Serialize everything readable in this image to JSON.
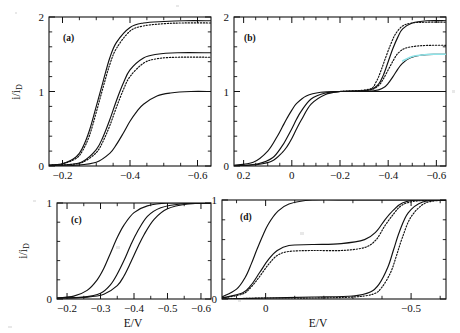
{
  "figure": {
    "y_axis_label_main": "i/i",
    "y_axis_label_sub": "D",
    "x_axis_label": "E/V"
  },
  "panels": [
    {
      "tag": "(a)",
      "x_ticks": [
        "-0.2",
        "-0.4",
        "-0.6"
      ],
      "y_ticks": [
        "0",
        "1",
        "2"
      ],
      "xlim": [
        -0.16,
        -0.64
      ],
      "ylim": [
        0,
        2
      ]
    },
    {
      "tag": "(b)",
      "x_ticks": [
        "0.2",
        "0",
        "-0.2",
        "-0.4",
        "-0.6"
      ],
      "y_ticks": [
        "0",
        "1",
        "2"
      ],
      "xlim": [
        0.24,
        -0.64
      ],
      "ylim": [
        0,
        2
      ]
    },
    {
      "tag": "(c)",
      "x_ticks": [
        "-0.2",
        "-0.3",
        "-0.4",
        "-0.5",
        "-0.6"
      ],
      "y_ticks": [
        "0",
        "1"
      ],
      "xlim": [
        -0.17,
        -0.63
      ],
      "ylim": [
        0,
        1
      ]
    },
    {
      "tag": "(d)",
      "x_ticks": [
        "0",
        "-0.5"
      ],
      "y_ticks": [
        "0",
        "1"
      ],
      "xlim": [
        0.15,
        -0.62
      ],
      "ylim": [
        0,
        1
      ]
    }
  ],
  "chart_data": {
    "type": "line",
    "title": "",
    "xlabel": "E/V",
    "ylabel": "i/i_D",
    "panels": [
      {
        "tag": "(a)",
        "xlim": [
          -0.16,
          -0.64
        ],
        "ylim": [
          0,
          2
        ],
        "xticks": [
          -0.2,
          -0.4,
          -0.6
        ],
        "yticks": [
          0,
          1,
          2
        ],
        "grid": false,
        "legend": "none",
        "series": [
          {
            "name": "a-solid-1",
            "style": "solid",
            "color": "#111111",
            "plateau": 1.95,
            "half_wave": -0.315,
            "slope": 0.048,
            "x": [
              -0.16,
              -0.2,
              -0.24,
              -0.26,
              -0.28,
              -0.3,
              -0.32,
              -0.34,
              -0.36,
              -0.4,
              -0.44,
              -0.5,
              -0.56,
              -0.64
            ],
            "y": [
              0.01,
              0.03,
              0.12,
              0.25,
              0.48,
              0.8,
              1.13,
              1.45,
              1.66,
              1.86,
              1.92,
              1.94,
              1.95,
              1.95
            ]
          },
          {
            "name": "a-dotted-1",
            "style": "dotted",
            "color": "#111111",
            "plateau": 1.92,
            "half_wave": -0.322,
            "slope": 0.05,
            "x": [
              -0.16,
              -0.2,
              -0.24,
              -0.26,
              -0.28,
              -0.3,
              -0.32,
              -0.34,
              -0.36,
              -0.4,
              -0.44,
              -0.5,
              -0.56,
              -0.64
            ],
            "y": [
              0.01,
              0.03,
              0.1,
              0.21,
              0.41,
              0.72,
              1.05,
              1.36,
              1.58,
              1.81,
              1.88,
              1.91,
              1.92,
              1.92
            ]
          },
          {
            "name": "a-solid-2",
            "style": "solid",
            "color": "#111111",
            "plateau": 1.52,
            "half_wave": -0.36,
            "slope": 0.046,
            "x": [
              -0.16,
              -0.22,
              -0.26,
              -0.3,
              -0.32,
              -0.34,
              -0.36,
              -0.38,
              -0.4,
              -0.44,
              -0.48,
              -0.54,
              -0.64
            ],
            "y": [
              0.01,
              0.02,
              0.06,
              0.22,
              0.39,
              0.62,
              0.88,
              1.11,
              1.29,
              1.45,
              1.5,
              1.52,
              1.52
            ]
          },
          {
            "name": "a-dotted-2",
            "style": "dotted",
            "color": "#111111",
            "plateau": 1.46,
            "half_wave": -0.366,
            "slope": 0.048,
            "x": [
              -0.16,
              -0.22,
              -0.26,
              -0.3,
              -0.32,
              -0.34,
              -0.36,
              -0.38,
              -0.4,
              -0.44,
              -0.48,
              -0.54,
              -0.64
            ],
            "y": [
              0.01,
              0.02,
              0.05,
              0.18,
              0.33,
              0.54,
              0.79,
              1.02,
              1.2,
              1.38,
              1.44,
              1.46,
              1.46
            ]
          },
          {
            "name": "a-solid-3",
            "style": "solid",
            "color": "#111111",
            "plateau": 1.0,
            "half_wave": -0.392,
            "slope": 0.05,
            "x": [
              -0.16,
              -0.24,
              -0.3,
              -0.34,
              -0.36,
              -0.38,
              -0.4,
              -0.42,
              -0.44,
              -0.48,
              -0.52,
              -0.58,
              -0.64
            ],
            "y": [
              0.0,
              0.01,
              0.05,
              0.17,
              0.29,
              0.44,
              0.6,
              0.73,
              0.83,
              0.94,
              0.98,
              1.0,
              1.0
            ]
          }
        ]
      },
      {
        "tag": "(b)",
        "xlim": [
          0.24,
          -0.64
        ],
        "ylim": [
          0,
          2
        ],
        "xticks": [
          0.2,
          0.0,
          -0.2,
          -0.4,
          -0.6
        ],
        "yticks": [
          0,
          1,
          2
        ],
        "grid": false,
        "legend": "none",
        "note": "Two-wave voltammograms: first wave rises to a common plateau of 1 near E = 0, second wave rises from 1 to 1.95, 1.6 or stays at 1.",
        "series": [
          {
            "name": "b-wave1-a",
            "style": "solid",
            "color": "#111111",
            "plateau": 1.0,
            "half_wave": 0.045,
            "x": [
              0.24,
              0.16,
              0.1,
              0.06,
              0.04,
              0.02,
              0.0,
              -0.02,
              -0.06,
              -0.12,
              -0.2
            ],
            "y": [
              0.01,
              0.05,
              0.2,
              0.4,
              0.52,
              0.64,
              0.75,
              0.84,
              0.94,
              0.99,
              1.0
            ]
          },
          {
            "name": "b-wave1-b",
            "style": "solid",
            "color": "#111111",
            "plateau": 1.0,
            "half_wave": 0.01,
            "x": [
              0.24,
              0.14,
              0.08,
              0.04,
              0.02,
              0.0,
              -0.02,
              -0.04,
              -0.08,
              -0.14,
              -0.2
            ],
            "y": [
              0.0,
              0.03,
              0.11,
              0.27,
              0.38,
              0.5,
              0.63,
              0.74,
              0.9,
              0.98,
              1.0
            ]
          },
          {
            "name": "b-wave1-c",
            "style": "solid",
            "color": "#111111",
            "plateau": 1.0,
            "half_wave": -0.012,
            "x": [
              0.24,
              0.14,
              0.08,
              0.04,
              0.02,
              0.0,
              -0.02,
              -0.04,
              -0.08,
              -0.14,
              -0.2
            ],
            "y": [
              0.0,
              0.02,
              0.07,
              0.18,
              0.26,
              0.37,
              0.5,
              0.62,
              0.83,
              0.96,
              1.0
            ]
          },
          {
            "name": "b-wave2-solid-high",
            "style": "solid",
            "color": "#111111",
            "plateau": 1.95,
            "half_wave": -0.415,
            "x": [
              -0.2,
              -0.32,
              -0.36,
              -0.38,
              -0.4,
              -0.42,
              -0.44,
              -0.46,
              -0.5,
              -0.56,
              -0.64
            ],
            "y": [
              1.0,
              1.02,
              1.1,
              1.22,
              1.4,
              1.58,
              1.73,
              1.84,
              1.92,
              1.95,
              1.95
            ]
          },
          {
            "name": "b-wave2-dotted-high",
            "style": "dotted",
            "color": "#111111",
            "plateau": 1.93,
            "half_wave": -0.408,
            "x": [
              -0.2,
              -0.32,
              -0.35,
              -0.37,
              -0.39,
              -0.41,
              -0.43,
              -0.46,
              -0.5,
              -0.56,
              -0.64
            ],
            "y": [
              1.0,
              1.03,
              1.13,
              1.28,
              1.46,
              1.63,
              1.77,
              1.88,
              1.92,
              1.93,
              1.93
            ]
          },
          {
            "name": "b-wave2-dotted-mid",
            "style": "dotted",
            "color": "#111111",
            "plateau": 1.62,
            "half_wave": -0.418,
            "x": [
              -0.2,
              -0.32,
              -0.36,
              -0.38,
              -0.4,
              -0.42,
              -0.44,
              -0.47,
              -0.52,
              -0.58,
              -0.64
            ],
            "y": [
              1.0,
              1.02,
              1.08,
              1.17,
              1.29,
              1.41,
              1.51,
              1.58,
              1.61,
              1.62,
              1.62
            ]
          },
          {
            "name": "b-wave2-solid-mid",
            "style": "solid",
            "color": "#111111",
            "plateau": 1.5,
            "half_wave": -0.432,
            "x": [
              -0.2,
              -0.34,
              -0.38,
              -0.4,
              -0.42,
              -0.44,
              -0.46,
              -0.49,
              -0.54,
              -0.6,
              -0.64
            ],
            "y": [
              1.0,
              1.01,
              1.05,
              1.11,
              1.2,
              1.3,
              1.38,
              1.45,
              1.49,
              1.5,
              1.5
            ]
          },
          {
            "name": "b-wave2-tint-mid",
            "style": "tinted",
            "color": "#8fe3e8",
            "plateau": 1.5,
            "x": [
              -0.46,
              -0.5,
              -0.54,
              -0.58,
              -0.62,
              -0.64
            ],
            "y": [
              1.41,
              1.47,
              1.49,
              1.5,
              1.5,
              1.5
            ]
          },
          {
            "name": "b-flat-1",
            "style": "solid",
            "color": "#111111",
            "plateau": 1.0,
            "x": [
              -0.2,
              -0.4,
              -0.64
            ],
            "y": [
              1.0,
              1.0,
              1.0
            ]
          }
        ]
      },
      {
        "tag": "(c)",
        "xlim": [
          -0.17,
          -0.63
        ],
        "ylim": [
          0,
          1
        ],
        "xticks": [
          -0.2,
          -0.3,
          -0.4,
          -0.5,
          -0.6
        ],
        "yticks": [
          0,
          1
        ],
        "grid": false,
        "legend": "none",
        "series": [
          {
            "name": "c-solid-1",
            "style": "solid",
            "color": "#111111",
            "plateau": 1.0,
            "half_wave": -0.335,
            "x": [
              -0.17,
              -0.22,
              -0.26,
              -0.29,
              -0.31,
              -0.33,
              -0.35,
              -0.37,
              -0.4,
              -0.44,
              -0.5,
              -0.63
            ],
            "y": [
              0.01,
              0.03,
              0.09,
              0.2,
              0.32,
              0.48,
              0.64,
              0.77,
              0.9,
              0.97,
              1.0,
              1.0
            ]
          },
          {
            "name": "c-solid-2",
            "style": "solid",
            "color": "#111111",
            "plateau": 1.0,
            "half_wave": -0.385,
            "x": [
              -0.17,
              -0.25,
              -0.3,
              -0.33,
              -0.35,
              -0.37,
              -0.39,
              -0.41,
              -0.44,
              -0.48,
              -0.54,
              -0.63
            ],
            "y": [
              0.01,
              0.02,
              0.06,
              0.15,
              0.26,
              0.4,
              0.56,
              0.7,
              0.86,
              0.95,
              0.99,
              1.0
            ]
          },
          {
            "name": "c-solid-3",
            "style": "solid",
            "color": "#111111",
            "plateau": 1.0,
            "half_wave": -0.405,
            "x": [
              -0.17,
              -0.26,
              -0.31,
              -0.35,
              -0.37,
              -0.39,
              -0.41,
              -0.43,
              -0.46,
              -0.5,
              -0.56,
              -0.63
            ],
            "y": [
              0.01,
              0.02,
              0.05,
              0.14,
              0.24,
              0.38,
              0.53,
              0.67,
              0.83,
              0.94,
              0.99,
              1.0
            ]
          }
        ]
      },
      {
        "tag": "(d)",
        "xlim": [
          0.15,
          -0.62
        ],
        "ylim": [
          0,
          1
        ],
        "xticks": [
          0.0,
          -0.5
        ],
        "yticks": [
          0,
          1
        ],
        "grid": false,
        "legend": "none",
        "note": "Curves with differing intermediate plateaus at 1.0, ~0.55, ~0.50 and ~0.02 before merging at 1 near -0.45 V.",
        "series": [
          {
            "name": "d-solid-full",
            "style": "solid",
            "color": "#111111",
            "plateau": 1.0,
            "half_wave": 0.03,
            "x": [
              0.15,
              0.1,
              0.07,
              0.05,
              0.03,
              0.01,
              -0.01,
              -0.04,
              -0.08,
              -0.16,
              -0.3,
              -0.45,
              -0.62
            ],
            "y": [
              0.02,
              0.1,
              0.22,
              0.35,
              0.5,
              0.64,
              0.76,
              0.88,
              0.96,
              1.0,
              1.0,
              1.0,
              1.0
            ]
          },
          {
            "name": "d-solid-mid",
            "style": "solid",
            "color": "#111111",
            "plateau_1": 0.55,
            "plateau_2": 1.0,
            "x": [
              0.15,
              0.08,
              0.05,
              0.02,
              -0.01,
              -0.04,
              -0.08,
              -0.16,
              -0.26,
              -0.34,
              -0.38,
              -0.41,
              -0.44,
              -0.47,
              -0.52,
              -0.62
            ],
            "y": [
              0.01,
              0.06,
              0.14,
              0.27,
              0.4,
              0.49,
              0.54,
              0.55,
              0.56,
              0.6,
              0.68,
              0.8,
              0.9,
              0.97,
              1.0,
              1.0
            ]
          },
          {
            "name": "d-dotted-mid",
            "style": "dotted",
            "color": "#111111",
            "plateau_1": 0.49,
            "plateau_2": 1.0,
            "x": [
              0.15,
              0.08,
              0.05,
              0.02,
              -0.01,
              -0.04,
              -0.08,
              -0.16,
              -0.26,
              -0.34,
              -0.38,
              -0.41,
              -0.44,
              -0.47,
              -0.52,
              -0.62
            ],
            "y": [
              0.01,
              0.05,
              0.12,
              0.23,
              0.35,
              0.44,
              0.48,
              0.49,
              0.49,
              0.52,
              0.6,
              0.74,
              0.86,
              0.95,
              0.99,
              1.0
            ]
          },
          {
            "name": "d-solid-low",
            "style": "solid",
            "color": "#111111",
            "plateau_1": 0.02,
            "plateau_2": 1.0,
            "x": [
              0.15,
              0.0,
              -0.16,
              -0.3,
              -0.36,
              -0.39,
              -0.42,
              -0.44,
              -0.46,
              -0.49,
              -0.54,
              -0.62
            ],
            "y": [
              0.0,
              0.01,
              0.02,
              0.03,
              0.07,
              0.15,
              0.32,
              0.5,
              0.68,
              0.87,
              0.98,
              1.0
            ]
          },
          {
            "name": "d-dotted-low",
            "style": "dotted",
            "color": "#111111",
            "plateau_1": 0.01,
            "plateau_2": 1.0,
            "x": [
              0.15,
              0.0,
              -0.16,
              -0.3,
              -0.37,
              -0.4,
              -0.43,
              -0.45,
              -0.47,
              -0.5,
              -0.55,
              -0.62
            ],
            "y": [
              0.0,
              0.01,
              0.01,
              0.02,
              0.05,
              0.12,
              0.27,
              0.44,
              0.62,
              0.83,
              0.97,
              1.0
            ]
          }
        ]
      }
    ]
  }
}
